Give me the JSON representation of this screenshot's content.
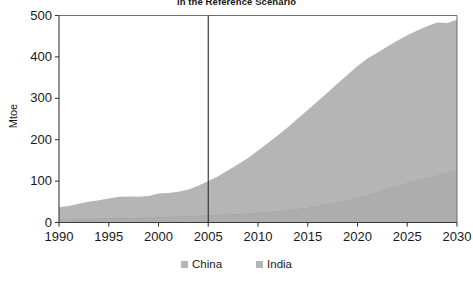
{
  "chart_data": {
    "type": "area",
    "stacked": true,
    "title": "in the Reference Scenario",
    "xlabel": "",
    "ylabel": "Mtoe",
    "xlim": [
      1990,
      2030
    ],
    "ylim": [
      0,
      500
    ],
    "xticks": [
      1990,
      1995,
      2000,
      2005,
      2010,
      2015,
      2020,
      2025,
      2030
    ],
    "yticks": [
      0,
      100,
      200,
      300,
      400,
      500
    ],
    "grid": false,
    "legend_position": "bottom",
    "projection_divider_x": 2005,
    "x": [
      1990,
      1991,
      1992,
      1993,
      1994,
      1995,
      1996,
      1997,
      1998,
      1999,
      2000,
      2001,
      2002,
      2003,
      2004,
      2005,
      2006,
      2007,
      2008,
      2009,
      2010,
      2011,
      2012,
      2013,
      2014,
      2015,
      2016,
      2017,
      2018,
      2019,
      2020,
      2021,
      2022,
      2023,
      2024,
      2025,
      2026,
      2027,
      2028,
      2029,
      2030
    ],
    "series": [
      {
        "name": "India",
        "color": "#adadad",
        "values": [
          8,
          8,
          9,
          9,
          10,
          10,
          11,
          11,
          12,
          12,
          13,
          14,
          15,
          16,
          17,
          18,
          19,
          20,
          21,
          22,
          24,
          26,
          28,
          30,
          33,
          36,
          40,
          44,
          49,
          54,
          60,
          66,
          73,
          81,
          89,
          96,
          102,
          108,
          114,
          121,
          128
        ]
      },
      {
        "name": "China",
        "color": "#b5b5b5",
        "values": [
          29,
          32,
          36,
          41,
          44,
          48,
          51,
          52,
          50,
          52,
          57,
          57,
          59,
          64,
          72,
          82,
          93,
          106,
          120,
          134,
          150,
          166,
          183,
          200,
          218,
          236,
          253,
          270,
          287,
          303,
          318,
          330,
          337,
          344,
          350,
          356,
          362,
          366,
          369,
          361,
          362
        ]
      }
    ],
    "totals": [
      37,
      40,
      45,
      50,
      54,
      58,
      62,
      63,
      62,
      64,
      70,
      71,
      74,
      80,
      89,
      100,
      112,
      126,
      141,
      156,
      174,
      192,
      211,
      230,
      251,
      272,
      293,
      314,
      336,
      357,
      378,
      396,
      410,
      425,
      439,
      452,
      464,
      474,
      483,
      482,
      490
    ]
  },
  "legend": {
    "items": [
      {
        "label": "China",
        "color": "#b5b5b5"
      },
      {
        "label": "India",
        "color": "#b5b5b5"
      }
    ]
  },
  "axes": {
    "y_title": "Mtoe"
  }
}
